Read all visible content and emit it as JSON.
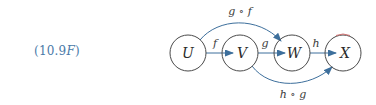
{
  "equation": {
    "prefix": "(10.9",
    "suffix_italic": "F",
    "close": ")"
  },
  "colors": {
    "arrow": "#3d6f9c",
    "node_stroke": "#4a4a4a",
    "label": "#4a7aa8"
  },
  "diagram": {
    "nodes": [
      {
        "id": "U",
        "label": "U",
        "cx": 188,
        "cy": 53,
        "r": 18
      },
      {
        "id": "V",
        "label": "V",
        "cx": 240,
        "cy": 53,
        "r": 18
      },
      {
        "id": "W",
        "label": "W",
        "cx": 292,
        "cy": 53,
        "r": 18
      },
      {
        "id": "X",
        "label": "X",
        "cx": 343,
        "cy": 53,
        "r": 18
      }
    ],
    "edges": [
      {
        "from": "U",
        "to": "V",
        "label": "f"
      },
      {
        "from": "V",
        "to": "W",
        "label": "g"
      },
      {
        "from": "W",
        "to": "X",
        "label": "h"
      },
      {
        "from": "U",
        "to": "W",
        "label": "g ∘ f",
        "curve": "above"
      },
      {
        "from": "V",
        "to": "X",
        "label": "h ∘ g",
        "curve": "below"
      }
    ]
  }
}
